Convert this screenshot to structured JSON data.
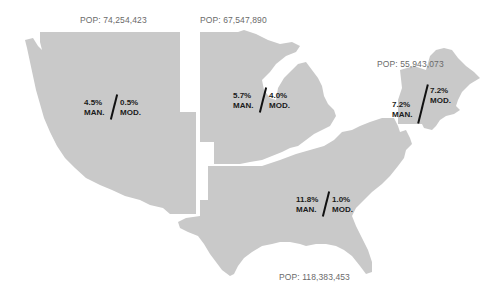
{
  "map": {
    "fill_color": "#c9c9c9",
    "text_color": "#1a1a1a",
    "pop_label_color": "#6a6a6a",
    "regions": [
      {
        "id": "west",
        "population_label": "POP: 74,254,423",
        "man_value": "4.5%",
        "man_label": "MAN.",
        "mod_value": "0.5%",
        "mod_label": "MOD."
      },
      {
        "id": "midwest",
        "population_label": "POP: 67,547,890",
        "man_value": "5.7%",
        "man_label": "MAN.",
        "mod_value": "4.0%",
        "mod_label": "MOD."
      },
      {
        "id": "northeast",
        "population_label": "POP: 55,943,073",
        "man_value": "7.2%",
        "man_label": "MAN.",
        "mod_value": "7.2%",
        "mod_label": "MOD."
      },
      {
        "id": "south",
        "population_label": "POP: 118,383,453",
        "man_value": "11.8%",
        "man_label": "MAN.",
        "mod_value": "1.0%",
        "mod_label": "MOD."
      }
    ]
  }
}
